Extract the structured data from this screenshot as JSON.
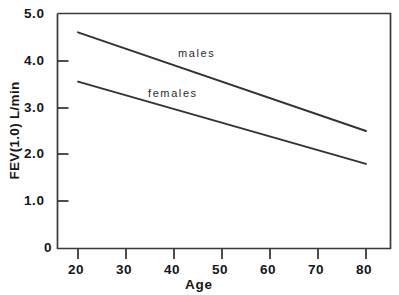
{
  "chart_data": {
    "type": "line",
    "title": "",
    "xlabel": "Age",
    "ylabel": "FEV(1.0) L/min",
    "xlim": [
      16,
      85
    ],
    "ylim": [
      0,
      5.0
    ],
    "xticks": [
      20,
      30,
      40,
      50,
      60,
      70,
      80
    ],
    "xtick_labels": [
      "20",
      "30",
      "40",
      "50",
      "60",
      "70",
      "80"
    ],
    "yticks": [
      0,
      1.0,
      2.0,
      3.0,
      4.0,
      5.0
    ],
    "ytick_labels": [
      "0",
      "1.0",
      "2.0",
      "3.0",
      "4.0",
      "5.0"
    ],
    "grid": false,
    "legend_position": "inline-annotation",
    "series": [
      {
        "name": "males",
        "label": "males",
        "color": "#333333",
        "x": [
          20,
          80
        ],
        "values": [
          4.6,
          2.5
        ],
        "annotation": {
          "text": "males",
          "x": 47,
          "y": 4.15
        }
      },
      {
        "name": "females",
        "label": "females",
        "color": "#333333",
        "x": [
          20,
          80
        ],
        "values": [
          3.55,
          1.8
        ],
        "annotation": {
          "text": "females",
          "x": 38,
          "y": 3.3
        }
      }
    ]
  },
  "axes": {
    "frame_color": "#3a3a3a",
    "line_color": "#333333"
  }
}
